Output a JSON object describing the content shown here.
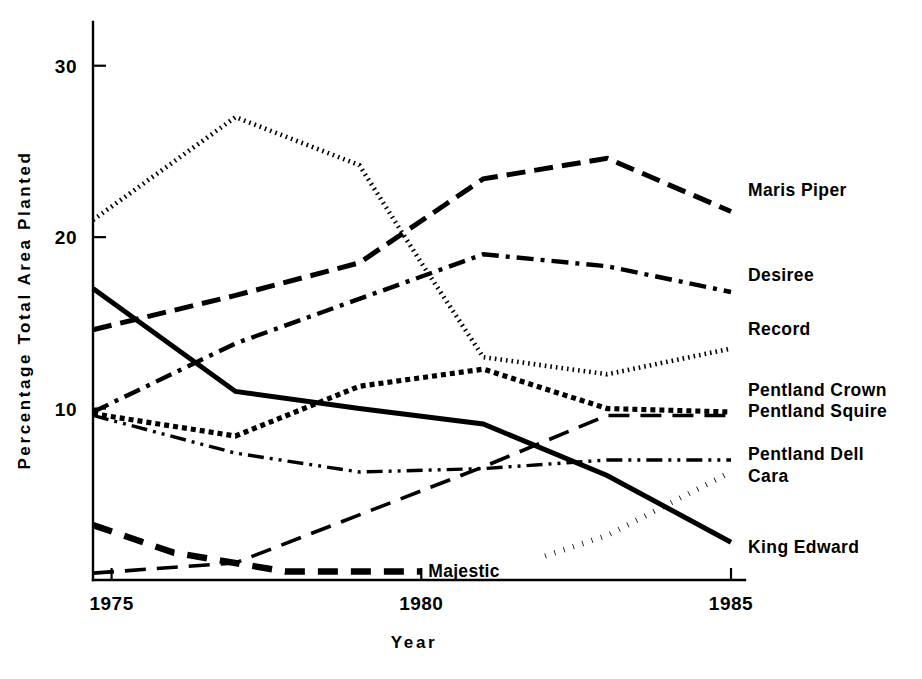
{
  "chart_data": {
    "type": "line",
    "title": "",
    "xlabel": "Year",
    "ylabel": "Percentage Total Area Planted",
    "xlim": [
      1974.7,
      1985.0
    ],
    "ylim": [
      0,
      31.5
    ],
    "xticks": [
      1975,
      1980,
      1985
    ],
    "xtick_labels": [
      "1975",
      "1980",
      "1985"
    ],
    "yticks": [
      10,
      20,
      30
    ],
    "ytick_labels": [
      "10",
      "20",
      "30"
    ],
    "grid": false,
    "legend_position": "right-of-axes-inline",
    "series": [
      {
        "name": "Maris Piper",
        "label": "Maris Piper",
        "style": "long-dash",
        "x": [
          1974.7,
          1977,
          1979,
          1981,
          1983,
          1985
        ],
        "values": [
          14.6,
          16.6,
          18.5,
          23.4,
          24.6,
          21.5
        ]
      },
      {
        "name": "Desiree",
        "label": "Desiree",
        "style": "dash-dot",
        "x": [
          1974.7,
          1977,
          1979,
          1981,
          1983,
          1985
        ],
        "values": [
          9.8,
          13.8,
          16.4,
          19.0,
          18.3,
          16.8
        ]
      },
      {
        "name": "Record",
        "label": "Record",
        "style": "dotted-fine",
        "x": [
          1974.7,
          1977,
          1979,
          1980,
          1981,
          1983,
          1985
        ],
        "values": [
          21.0,
          27.0,
          24.2,
          18.5,
          13.0,
          12.0,
          13.5
        ]
      },
      {
        "name": "Pentland Crown",
        "label": "Pentland Crown",
        "style": "dotted-square",
        "x": [
          1974.7,
          1977,
          1979,
          1981,
          1983,
          1985
        ],
        "values": [
          9.7,
          8.4,
          11.3,
          12.3,
          10.0,
          9.8
        ]
      },
      {
        "name": "Pentland Squire",
        "label": "Pentland Squire",
        "style": "long-dash-thin",
        "x": [
          1974.7,
          1977,
          1979,
          1981,
          1983,
          1985
        ],
        "values": [
          0.4,
          1.0,
          3.8,
          6.6,
          9.6,
          9.6
        ]
      },
      {
        "name": "Pentland Dell",
        "label": "Pentland Dell",
        "style": "dash-dot-dot",
        "x": [
          1974.7,
          1977,
          1979,
          1981,
          1983,
          1985
        ],
        "values": [
          9.6,
          7.4,
          6.3,
          6.5,
          7.0,
          7.0
        ]
      },
      {
        "name": "Cara",
        "label": "Cara",
        "style": "dotted-round",
        "x": [
          1982,
          1983,
          1985
        ],
        "values": [
          1.4,
          2.6,
          6.3
        ]
      },
      {
        "name": "King Edward",
        "label": "King Edward",
        "style": "solid",
        "x": [
          1974.7,
          1977,
          1979,
          1981,
          1983,
          1985
        ],
        "values": [
          17.0,
          11.0,
          10.0,
          9.1,
          6.1,
          2.2
        ]
      },
      {
        "name": "Majestic",
        "label": "Majestic",
        "style": "heavy-dash",
        "x": [
          1974.7,
          1976,
          1977.8,
          1980
        ],
        "values": [
          3.2,
          1.6,
          0.5,
          0.5
        ]
      }
    ]
  },
  "axes": {
    "y_axis_title": "Percentage Total Area Planted",
    "x_axis_title": "Year"
  }
}
